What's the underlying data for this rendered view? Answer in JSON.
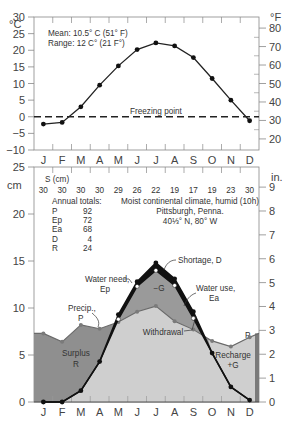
{
  "chart_data": [
    {
      "type": "line",
      "title": "",
      "ylabel_left": "°C",
      "ylabel_right": "°F",
      "ylim": [
        -10,
        30
      ],
      "yticks_left": [
        30,
        25,
        20,
        15,
        10,
        5,
        0,
        -5,
        -10
      ],
      "yticks_right": [
        80,
        70,
        60,
        50,
        40,
        30,
        20
      ],
      "categories": [
        "J",
        "F",
        "M",
        "A",
        "M",
        "J",
        "J",
        "A",
        "S",
        "O",
        "N",
        "D"
      ],
      "series": [
        {
          "name": "Temperature",
          "values": [
            -2.2,
            -1.7,
            3.0,
            9.5,
            15.3,
            20.2,
            22.2,
            21.3,
            17.8,
            11.5,
            5.0,
            -1.2
          ]
        }
      ],
      "annotations": {
        "mean": "Mean: 10.5° C (51° F)",
        "range": "Range: 12 C° (21 F°)",
        "freezing": "Freezing point"
      },
      "freezing_point_c": 0
    },
    {
      "type": "area",
      "title": "Moist continental climate, humid (10h)",
      "location": [
        "Pittsburgh, Penna.",
        "40⅓° N, 80° W"
      ],
      "ylabel_left": "cm",
      "ylabel_right": "in.",
      "ylim": [
        0,
        25
      ],
      "yticks_left": [
        25,
        20,
        15,
        10,
        5,
        0
      ],
      "yticks_right": [
        9,
        8,
        7,
        6,
        5,
        4,
        3,
        2,
        1,
        0
      ],
      "categories": [
        "J",
        "F",
        "M",
        "A",
        "M",
        "J",
        "J",
        "A",
        "S",
        "O",
        "N",
        "D"
      ],
      "storage_label": "S (cm)",
      "storage": [
        30,
        30,
        30,
        30,
        29,
        26,
        22,
        19,
        17,
        19,
        23,
        30
      ],
      "annual_totals_label": "Annual totals:",
      "annual_totals": [
        {
          "k": "P",
          "v": "92"
        },
        {
          "k": "Ep",
          "v": "72"
        },
        {
          "k": "Ea",
          "v": "68"
        },
        {
          "k": "D",
          "v": "4"
        },
        {
          "k": "R",
          "v": "24"
        }
      ],
      "series": [
        {
          "name": "Precip., P",
          "values": [
            7.3,
            6.4,
            8.2,
            7.8,
            8.5,
            9.6,
            10.2,
            8.6,
            7.7,
            6.5,
            5.9,
            6.9
          ]
        },
        {
          "name": "Water need, Ep",
          "values": [
            0,
            0,
            1.2,
            4.3,
            9.3,
            12.8,
            14.8,
            13.1,
            9.6,
            5.2,
            1.6,
            0.2
          ]
        },
        {
          "name": "Water use, Ea",
          "values": [
            0,
            0,
            1.2,
            4.3,
            8.8,
            12.3,
            14.0,
            12.4,
            8.9,
            5.2,
            1.6,
            0.2
          ]
        }
      ],
      "labels": {
        "surplus": [
          "Surplus",
          "R"
        ],
        "withdrawal": "Withdrawal",
        "recharge": [
          "Recharge",
          "+G"
        ],
        "minus_g": "−G",
        "shortage": "Shortage, D",
        "water_need": [
          "Water need,",
          "Ep"
        ],
        "water_use": [
          "Water use,",
          "Ea"
        ],
        "precip": [
          "Precip.,",
          "P"
        ],
        "p_end": "P"
      }
    }
  ]
}
